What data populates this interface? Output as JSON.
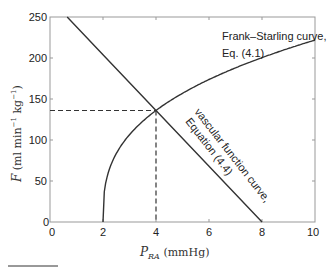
{
  "chart_data": {
    "type": "line",
    "title": "",
    "xlabel": "P_RA (mmHg)",
    "xlabel_main": "P",
    "xlabel_sub": "RA",
    "xlabel_unit": " (mmHg)",
    "ylabel": "F (ml min^-1 kg^-1)",
    "ylabel_main": "F",
    "ylabel_unit_open": " (ml min",
    "ylabel_exp1": "−1",
    "ylabel_mid": " kg",
    "ylabel_exp2": "−1",
    "ylabel_close": ")",
    "xlim": [
      0,
      10
    ],
    "ylim": [
      0,
      250
    ],
    "xticks": [
      "0",
      "2",
      "4",
      "6",
      "8",
      "10"
    ],
    "yticks": [
      "0",
      "50",
      "100",
      "150",
      "200",
      "250"
    ],
    "grid": false,
    "series": [
      {
        "name": "Frank–Starling curve, Eq. (4.1)",
        "x": [
          2,
          2.25,
          2.5,
          3,
          3.5,
          4,
          5,
          6,
          7,
          8,
          9,
          10
        ],
        "values": [
          0,
          65,
          83,
          107,
          122,
          136,
          157,
          174,
          188,
          201,
          212,
          222
        ]
      },
      {
        "name": "vascular function curve, Equation (4.4)",
        "x": [
          0.65,
          2,
          4,
          6,
          8
        ],
        "values": [
          250,
          204,
          136,
          68,
          0
        ]
      }
    ],
    "annotations": {
      "frank_line1": "Frank–Starling curve,",
      "frank_line2": "Eq. (4.1)",
      "vascular_line1": "vascular function curve,",
      "vascular_line2": "Equation (4.4)",
      "equilibrium_point": {
        "x": 4,
        "y": 136
      }
    }
  }
}
